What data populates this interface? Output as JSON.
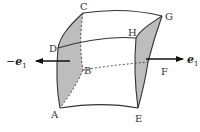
{
  "figure": {
    "vertices": {
      "A": "A",
      "B": "B",
      "C": "C",
      "D": "D",
      "E": "E",
      "F": "F",
      "G": "G",
      "H": "H"
    },
    "vectors": {
      "left": {
        "sign": "−",
        "symbol": "e",
        "subscript": "1"
      },
      "right": {
        "sign": "",
        "symbol": "e",
        "subscript": "1"
      }
    },
    "colors": {
      "face_fill": "#bdbdbd",
      "edge": "#333333",
      "arrow": "#111111"
    }
  }
}
